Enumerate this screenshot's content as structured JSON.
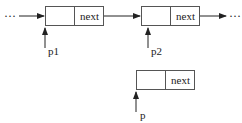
{
  "diagram": {
    "colors": {
      "stroke": "#555555",
      "text": "#222222",
      "background": "#ffffff"
    },
    "ellipsis_left": "···",
    "ellipsis_right": "···",
    "nodes": [
      {
        "id": "node1",
        "field": "next",
        "pointer": "p1"
      },
      {
        "id": "node2",
        "field": "next",
        "pointer": "p2"
      },
      {
        "id": "node3",
        "field": "next",
        "pointer": "p"
      }
    ]
  }
}
